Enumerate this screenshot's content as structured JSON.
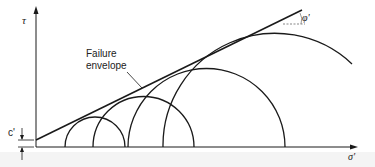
{
  "figure": {
    "type": "Mohr circles with failure envelope",
    "y_axis_label": "τ",
    "x_axis_label": "σ'",
    "envelope_label_line1": "Failure",
    "envelope_label_line2": "envelope",
    "intercept_label": "c'",
    "angle_label": "φ'",
    "colors": {
      "stroke": "#1a1a1a",
      "background": "#ffffff"
    },
    "circles": [
      {
        "id": "circle-1",
        "left_x": 65,
        "right_x": 125
      },
      {
        "id": "circle-2",
        "left_x": 93,
        "right_x": 194
      },
      {
        "id": "circle-3",
        "left_x": 128,
        "right_x": 285
      },
      {
        "id": "circle-4",
        "left_x": 163,
        "right_x": 387
      }
    ]
  }
}
